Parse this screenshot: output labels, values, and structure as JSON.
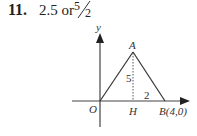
{
  "question": {
    "number": "11.",
    "answer_text": "2.5 or",
    "fraction": {
      "numerator": "5",
      "denominator": "2"
    }
  },
  "figure": {
    "axis_labels": {
      "y": "y"
    },
    "points": {
      "origin": "O",
      "apex": "A",
      "foot": "H",
      "b": "B(4,0)"
    },
    "measures": {
      "height": "5",
      "hb": "2"
    }
  }
}
